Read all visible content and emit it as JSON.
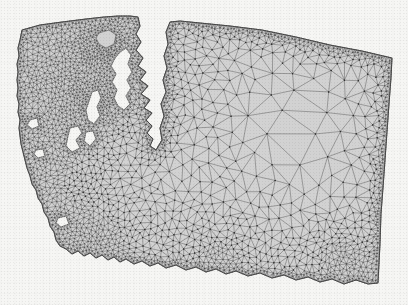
{
  "figure": {
    "kind": "unstructured-triangular-finite-element-mesh",
    "title": "",
    "caption": "",
    "background_note": "faint bleed-through text from reverse side of scanned page; illegible",
    "colors": {
      "page_background": "#f6f6f4",
      "mesh_fill": "#d2d2d2",
      "mesh_edge": "#4a4a4a",
      "mesh_node": "#2e2e2e",
      "boundary_edge": "#3a3a3a"
    },
    "line_widths": {
      "interior_edge": 0.45,
      "boundary_edge": 0.8
    },
    "node_radius": 0.75
  },
  "chart_data": {
    "type": "mesh",
    "title": "",
    "xlabel": "",
    "ylabel": "",
    "xlim": [
      0,
      408
    ],
    "ylim": [
      0,
      305
    ],
    "grid": false,
    "legend": null,
    "refinement_zones": [
      {
        "name": "puget-sound-inland-waters",
        "label": "finest",
        "approx_edge_px": 2.0,
        "center": [
          95,
          105
        ]
      },
      {
        "name": "san-juan-islands",
        "label": "finest",
        "approx_edge_px": 2.0,
        "center": [
          110,
          45
        ]
      },
      {
        "name": "pacific-coast",
        "label": "fine",
        "approx_edge_px": 4.5,
        "center": [
          35,
          150
        ]
      },
      {
        "name": "southwest-columbia-mouth",
        "label": "fine",
        "approx_edge_px": 3.5,
        "center": [
          90,
          245
        ]
      },
      {
        "name": "southern-columbia-river-boundary",
        "label": "fine",
        "approx_edge_px": 4.0,
        "center": [
          220,
          265
        ]
      },
      {
        "name": "southeast-corner",
        "label": "fine",
        "approx_edge_px": 4.0,
        "center": [
          345,
          262
        ]
      },
      {
        "name": "northern-border",
        "label": "medium",
        "approx_edge_px": 9.0,
        "center": [
          200,
          30
        ]
      },
      {
        "name": "central-cascades",
        "label": "medium",
        "approx_edge_px": 14.0,
        "center": [
          175,
          160
        ]
      },
      {
        "name": "eastern-interior",
        "label": "coarsest",
        "approx_edge_px": 34.0,
        "center": [
          300,
          130
        ]
      }
    ],
    "domain_boundary": {
      "name": "washington-state-outline",
      "features": [
        "slanted straight northern border from (22,30) to (392,58)",
        "highly convoluted Puget Sound inlets indenting from the north-center",
        "detached San Juan island polygon near (100,33)-(118,50)",
        "irregular Pacific coastline down the west side",
        "wiggly Columbia River southern boundary",
        "slightly slanted straight eastern border from (392,58) to (378,283)"
      ]
    }
  }
}
